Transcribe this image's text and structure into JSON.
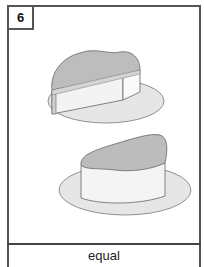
{
  "card": {
    "number": "6",
    "label": "equal",
    "illustration": {
      "items": [
        "cake-slice-wedge-on-plate",
        "cake-slice-rounded-on-plate"
      ],
      "colors": {
        "outline": "#666666",
        "frosting": "#b8b8b8",
        "cake_side": "#eeeeee",
        "plate": "#e6e6e6"
      }
    }
  }
}
